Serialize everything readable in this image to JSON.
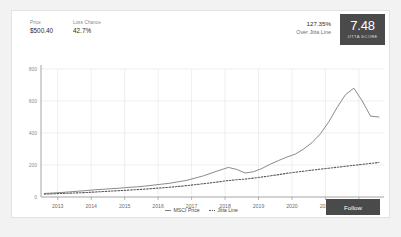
{
  "card": {
    "header": {
      "price": {
        "label": "Price",
        "value": "$500.40"
      },
      "loss_chance": {
        "label": "Loss Chance",
        "value": "42.7%"
      },
      "over_line": {
        "percent": "127.35%",
        "caption": "Over Jitta Line"
      },
      "score_badge": {
        "value": "7.48",
        "caption": "JITTA SCORE"
      }
    },
    "follow_button": "Follow"
  },
  "colors": {
    "badge_dark": "#4a4a4a",
    "msci_line": "#7d7d7d",
    "jitta_line": "#5a5a5a",
    "grid": "#e8e8e8",
    "axis": "#9a9a9a",
    "card_bg": "#ffffff",
    "page_bg": "#f2f2f2"
  },
  "chart_data": {
    "type": "line",
    "title": "",
    "xlabel": "",
    "ylabel": "",
    "grid": true,
    "legend_position": "bottom",
    "ylim": [
      0,
      800
    ],
    "yticks": [
      0,
      200,
      400,
      600,
      800
    ],
    "ytick_labels": [
      "0",
      "200",
      "400",
      "600",
      "800"
    ],
    "xlim": [
      2012.5,
      2022.75
    ],
    "xticks": [
      2013,
      2014,
      2015,
      2016,
      2017,
      2018,
      2019,
      2020,
      2021,
      2022
    ],
    "xtick_labels": [
      "2013",
      "2014",
      "2015",
      "2016",
      "2017",
      "2018",
      "2019",
      "2020",
      "2021",
      "2022"
    ],
    "x": [
      2012.6,
      2012.85,
      2013.1,
      2013.35,
      2013.6,
      2013.85,
      2014.1,
      2014.35,
      2014.6,
      2014.85,
      2015.1,
      2015.35,
      2015.6,
      2015.85,
      2016.1,
      2016.35,
      2016.6,
      2016.85,
      2017.1,
      2017.35,
      2017.6,
      2017.85,
      2018.1,
      2018.35,
      2018.6,
      2018.85,
      2019.1,
      2019.35,
      2019.6,
      2019.85,
      2020.1,
      2020.35,
      2020.6,
      2020.85,
      2021.1,
      2021.35,
      2021.6,
      2021.85,
      2022.1,
      2022.35,
      2022.6
    ],
    "series": [
      {
        "name": "MSCI Price",
        "style": "solid",
        "color": "#7d7d7d",
        "values": [
          22,
          25,
          28,
          32,
          36,
          40,
          45,
          48,
          52,
          55,
          60,
          63,
          68,
          74,
          80,
          86,
          95,
          104,
          118,
          132,
          150,
          168,
          185,
          172,
          150,
          158,
          178,
          205,
          228,
          250,
          268,
          300,
          340,
          395,
          470,
          560,
          640,
          680,
          600,
          505,
          500
        ]
      },
      {
        "name": "Jitta Line",
        "style": "dotted",
        "color": "#5a5a5a",
        "values": [
          18,
          20,
          22,
          24,
          26,
          28,
          31,
          34,
          37,
          40,
          43,
          46,
          49,
          53,
          57,
          61,
          66,
          71,
          77,
          83,
          89,
          96,
          103,
          108,
          112,
          118,
          125,
          132,
          140,
          148,
          155,
          161,
          168,
          174,
          180,
          186,
          192,
          198,
          204,
          210,
          216
        ]
      }
    ]
  }
}
